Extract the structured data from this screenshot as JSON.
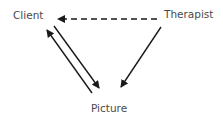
{
  "diagram": {
    "nodes": [
      {
        "id": "client",
        "label": "Client"
      },
      {
        "id": "therapist",
        "label": "Therapist"
      },
      {
        "id": "picture",
        "label": "Picture"
      }
    ],
    "edges": [
      {
        "from": "therapist",
        "to": "client",
        "style": "dashed"
      },
      {
        "from": "therapist",
        "to": "picture",
        "style": "solid"
      },
      {
        "from": "client",
        "to": "picture",
        "style": "solid"
      },
      {
        "from": "picture",
        "to": "client",
        "style": "solid"
      }
    ],
    "colors": {
      "line": "#1a1a1a",
      "text": "#4a4a4a",
      "background": "#ffffff"
    }
  }
}
